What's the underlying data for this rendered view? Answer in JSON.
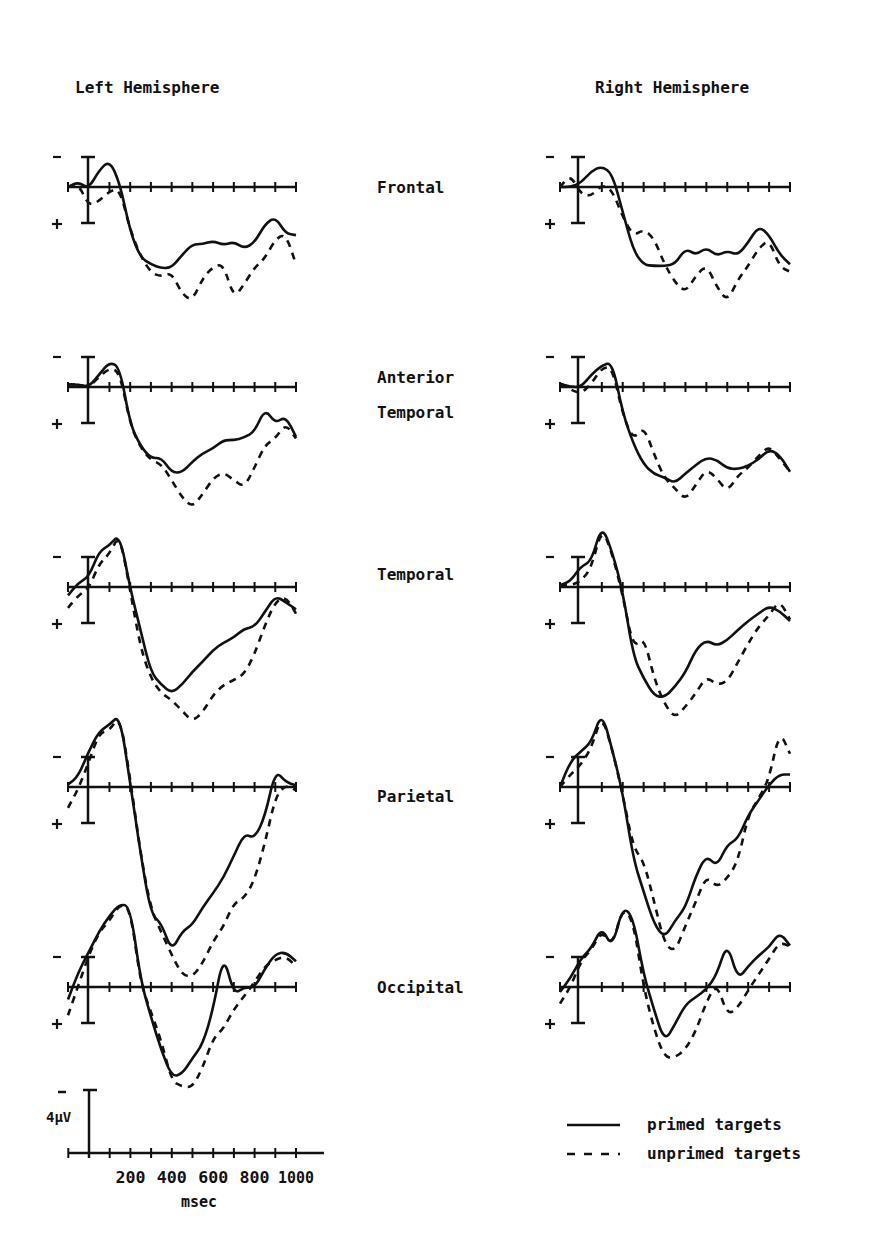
{
  "chart_data": {
    "type": "line",
    "title": "",
    "xlabel": "msec",
    "ylabel": "µV (negative up)",
    "x_range_ms": [
      -100,
      1000
    ],
    "x_ticks_ms": [
      -100,
      0,
      100,
      200,
      300,
      400,
      500,
      600,
      700,
      800,
      900,
      1000
    ],
    "x_tick_labels": [
      "200",
      "400",
      "600",
      "800",
      "1000"
    ],
    "calibration": {
      "label": "4µV",
      "value_uv": 4,
      "minus_sign": "-",
      "x_label": "msec"
    },
    "polarity": {
      "negative": "-",
      "positive": "+"
    },
    "columns": [
      "Left Hemisphere",
      "Right Hemisphere"
    ],
    "rows": [
      "Frontal",
      "Anterior Temporal",
      "Temporal",
      "Parietal",
      "Occipital"
    ],
    "row_labels": [
      [
        "Frontal"
      ],
      [
        "Anterior",
        "Temporal"
      ],
      [
        "Temporal"
      ],
      [
        "Parietal"
      ],
      [
        "Occipital"
      ]
    ],
    "legend": [
      {
        "name": "primed targets",
        "style": "solid"
      },
      {
        "name": "unprimed targets",
        "style": "dashed"
      }
    ],
    "legend_position": "bottom-right",
    "grid": false,
    "x_samples_ms": [
      -100,
      -50,
      0,
      50,
      100,
      150,
      200,
      250,
      300,
      350,
      400,
      450,
      500,
      550,
      600,
      650,
      700,
      750,
      800,
      850,
      900,
      950,
      1000
    ],
    "panels": [
      {
        "hemisphere": "Left Hemisphere",
        "site": "Frontal",
        "series": [
          {
            "name": "primed targets",
            "values": [
              0.0,
              0.6,
              -0.2,
              2.0,
              3.2,
              0.5,
              -5.4,
              -8.5,
              -9.3,
              -9.8,
              -9.7,
              -8.2,
              -6.9,
              -6.9,
              -6.5,
              -7.0,
              -6.6,
              -7.4,
              -6.7,
              -4.5,
              -3.6,
              -5.6,
              -5.8
            ]
          },
          {
            "name": "unprimed targets",
            "values": [
              0.0,
              0.4,
              -2.3,
              -1.7,
              -0.5,
              -0.2,
              -5.2,
              -8.3,
              -10.3,
              -10.8,
              -10.3,
              -12.9,
              -13.7,
              -11.0,
              -9.6,
              -9.3,
              -13.4,
              -11.7,
              -9.7,
              -8.6,
              -6.3,
              -5.6,
              -9.3
            ]
          }
        ]
      },
      {
        "hemisphere": "Left Hemisphere",
        "site": "Anterior Temporal",
        "series": [
          {
            "name": "primed targets",
            "values": [
              0.3,
              0.3,
              0.0,
              1.5,
              3.0,
              2.4,
              -4.5,
              -7.1,
              -8.6,
              -8.5,
              -10.3,
              -10.3,
              -9.0,
              -8.0,
              -7.4,
              -6.4,
              -6.4,
              -6.1,
              -5.4,
              -2.6,
              -4.4,
              -3.5,
              -6.0
            ]
          },
          {
            "name": "unprimed targets",
            "values": [
              0.3,
              0.3,
              0.0,
              1.2,
              2.3,
              1.8,
              -4.5,
              -7.3,
              -8.8,
              -9.3,
              -11.2,
              -13.3,
              -14.5,
              -12.9,
              -11.0,
              -10.3,
              -11.2,
              -12.1,
              -9.7,
              -7.0,
              -6.2,
              -4.4,
              -6.2
            ]
          }
        ]
      },
      {
        "hemisphere": "Left Hemisphere",
        "site": "Temporal",
        "series": [
          {
            "name": "primed targets",
            "values": [
              -1.0,
              0.5,
              1.2,
              4.3,
              5.0,
              6.4,
              -0.2,
              -5.2,
              -10.3,
              -11.8,
              -12.8,
              -11.8,
              -10.2,
              -9.0,
              -7.6,
              -6.7,
              -6.1,
              -5.0,
              -4.8,
              -3.0,
              -1.1,
              -1.8,
              -2.7
            ]
          },
          {
            "name": "unprimed targets",
            "values": [
              -2.5,
              -1.0,
              -0.2,
              2.8,
              4.0,
              6.4,
              -0.5,
              -7.3,
              -11.0,
              -12.8,
              -13.6,
              -14.9,
              -16.2,
              -15.1,
              -13.0,
              -11.8,
              -11.2,
              -10.5,
              -8.1,
              -4.6,
              -1.8,
              -1.1,
              -3.2
            ]
          }
        ]
      },
      {
        "hemisphere": "Left Hemisphere",
        "site": "Parietal",
        "series": [
          {
            "name": "primed targets",
            "values": [
              0.3,
              1.3,
              4.3,
              6.7,
              7.5,
              8.7,
              0.5,
              -8.0,
              -15.3,
              -16.4,
              -19.8,
              -17.4,
              -16.6,
              -14.5,
              -12.8,
              -10.9,
              -8.3,
              -5.6,
              -6.2,
              -3.6,
              2.0,
              0.6,
              0.2
            ]
          },
          {
            "name": "unprimed targets",
            "values": [
              -2.5,
              -0.2,
              3.0,
              6.5,
              6.8,
              8.7,
              1.0,
              -8.0,
              -14.7,
              -17.5,
              -20.2,
              -22.6,
              -22.9,
              -21.2,
              -18.6,
              -16.8,
              -14.0,
              -13.4,
              -11.2,
              -6.8,
              -1.2,
              0.3,
              -0.4
            ]
          }
        ]
      },
      {
        "hemisphere": "Left Hemisphere",
        "site": "Occipital",
        "series": [
          {
            "name": "primed targets",
            "values": [
              -1.5,
              1.8,
              4.2,
              6.7,
              8.6,
              10.0,
              9.7,
              0.9,
              -3.6,
              -7.6,
              -10.8,
              -10.5,
              -8.6,
              -6.9,
              -2.7,
              4.0,
              -0.9,
              0.0,
              -0.1,
              2.2,
              4.0,
              4.2,
              3.1
            ]
          },
          {
            "name": "unprimed targets",
            "values": [
              -3.4,
              0.2,
              3.8,
              6.6,
              8.0,
              10.0,
              9.5,
              0.5,
              -3.0,
              -6.5,
              -11.3,
              -12.0,
              -12.1,
              -9.7,
              -6.2,
              -5.0,
              -2.7,
              -1.1,
              0.6,
              2.5,
              3.3,
              3.7,
              2.5
            ]
          }
        ]
      },
      {
        "hemisphere": "Right Hemisphere",
        "site": "Frontal",
        "series": [
          {
            "name": "primed targets",
            "values": [
              0.0,
              0.0,
              0.5,
              1.9,
              2.5,
              1.6,
              -3.0,
              -7.6,
              -9.4,
              -9.5,
              -9.5,
              -9.3,
              -7.4,
              -8.2,
              -7.3,
              -8.3,
              -7.7,
              -8.2,
              -6.7,
              -4.7,
              -5.8,
              -8.1,
              -9.3
            ]
          },
          {
            "name": "unprimed targets",
            "values": [
              0.0,
              1.5,
              -0.9,
              -1.1,
              0.3,
              -0.4,
              -3.6,
              -5.9,
              -5.1,
              -6.2,
              -9.3,
              -11.5,
              -12.7,
              -10.7,
              -9.4,
              -12.0,
              -13.8,
              -11.2,
              -9.5,
              -7.4,
              -6.3,
              -9.6,
              -10.2
            ]
          }
        ]
      },
      {
        "hemisphere": "Right Hemisphere",
        "site": "Anterior Temporal",
        "series": [
          {
            "name": "primed targets",
            "values": [
              0.4,
              0.0,
              0.0,
              1.5,
              2.6,
              3.0,
              -3.1,
              -6.8,
              -9.3,
              -10.5,
              -10.9,
              -11.6,
              -10.4,
              -9.4,
              -8.5,
              -8.8,
              -9.8,
              -9.9,
              -9.5,
              -8.7,
              -7.5,
              -8.2,
              -10.2
            ]
          },
          {
            "name": "unprimed targets",
            "values": [
              0.4,
              -0.3,
              -0.8,
              0.4,
              2.3,
              2.4,
              -3.3,
              -6.4,
              -4.7,
              -8.1,
              -11.0,
              -12.2,
              -13.6,
              -11.8,
              -9.9,
              -11.0,
              -12.6,
              -10.7,
              -9.7,
              -8.3,
              -7.1,
              -8.6,
              -10.2
            ]
          }
        ]
      },
      {
        "hemisphere": "Right Hemisphere",
        "site": "Temporal",
        "series": [
          {
            "name": "primed targets",
            "values": [
              0.2,
              0.7,
              2.5,
              3.1,
              7.5,
              4.2,
              -0.5,
              -8.3,
              -11.0,
              -13.1,
              -13.3,
              -12.0,
              -10.3,
              -7.5,
              -6.4,
              -7.1,
              -6.4,
              -5.2,
              -4.1,
              -3.2,
              -2.3,
              -2.9,
              -4.1
            ]
          },
          {
            "name": "unprimed targets",
            "values": [
              0.2,
              0.2,
              0.7,
              2.3,
              7.2,
              4.0,
              -1.0,
              -7.4,
              -5.9,
              -11.0,
              -14.1,
              -15.8,
              -14.4,
              -12.8,
              -10.8,
              -11.8,
              -11.4,
              -9.1,
              -6.8,
              -4.8,
              -3.4,
              -1.6,
              -3.9
            ]
          }
        ]
      },
      {
        "hemisphere": "Right Hemisphere",
        "site": "Parietal",
        "series": [
          {
            "name": "primed targets",
            "values": [
              0.0,
              3.1,
              4.3,
              5.4,
              9.1,
              4.5,
              -0.7,
              -8.6,
              -12.6,
              -16.5,
              -18.2,
              -16.1,
              -14.5,
              -10.7,
              -8.2,
              -9.6,
              -6.9,
              -6.3,
              -3.4,
              -1.6,
              0.3,
              1.5,
              1.5
            ]
          },
          {
            "name": "unprimed targets",
            "values": [
              0.0,
              1.5,
              2.7,
              4.7,
              8.7,
              4.5,
              -0.9,
              -7.3,
              -8.9,
              -13.8,
              -18.9,
              -19.9,
              -16.7,
              -13.8,
              -10.7,
              -12.1,
              -11.0,
              -9.0,
              -3.4,
              -1.4,
              1.0,
              6.8,
              4.0
            ]
          }
        ]
      },
      {
        "hemisphere": "Right Hemisphere",
        "site": "Occipital",
        "series": [
          {
            "name": "primed targets",
            "values": [
              -0.6,
              1.1,
              3.4,
              4.7,
              7.2,
              4.7,
              9.7,
              8.4,
              1.5,
              -2.8,
              -6.6,
              -4.5,
              -2.1,
              -1.2,
              -0.3,
              1.5,
              5.4,
              0.9,
              2.5,
              3.8,
              4.8,
              6.6,
              5.0
            ]
          },
          {
            "name": "unprimed targets",
            "values": [
              -2.0,
              0.0,
              3.1,
              4.5,
              6.8,
              4.9,
              9.6,
              8.0,
              0.0,
              -5.1,
              -8.5,
              -8.5,
              -7.5,
              -5.3,
              -1.8,
              0.5,
              -3.4,
              -2.5,
              -0.4,
              1.5,
              3.4,
              5.4,
              4.9
            ]
          }
        ]
      }
    ]
  }
}
